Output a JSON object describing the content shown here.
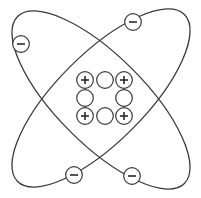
{
  "diagram": {
    "title": "",
    "type": "atom-model",
    "colors": {
      "line": "#3a3a3a",
      "fill": "#ffffff"
    },
    "orbits": [
      {
        "id": "orbit-a",
        "cx": 101,
        "cy": 100,
        "rx": 118,
        "ry": 44,
        "rotate": 45
      },
      {
        "id": "orbit-b",
        "cx": 101,
        "cy": 98,
        "rx": 118,
        "ry": 44,
        "rotate": -45
      }
    ],
    "electrons": [
      {
        "x": 21,
        "y": 44,
        "charge": "−"
      },
      {
        "x": 133,
        "y": 22,
        "charge": "−"
      },
      {
        "x": 74,
        "y": 175,
        "charge": "−"
      },
      {
        "x": 132,
        "y": 176,
        "charge": "−"
      }
    ],
    "nucleus": {
      "protons": [
        {
          "x": 85,
          "y": 80,
          "charge": "+"
        },
        {
          "x": 124,
          "y": 80,
          "charge": "+"
        },
        {
          "x": 85,
          "y": 116,
          "charge": "+"
        },
        {
          "x": 124,
          "y": 116,
          "charge": "+"
        }
      ],
      "neutrons": [
        {
          "x": 105,
          "y": 80
        },
        {
          "x": 85,
          "y": 98
        },
        {
          "x": 124,
          "y": 98
        },
        {
          "x": 105,
          "y": 116
        }
      ]
    },
    "counts": {
      "electrons": 4,
      "protons": 4,
      "neutrons": 4
    }
  }
}
